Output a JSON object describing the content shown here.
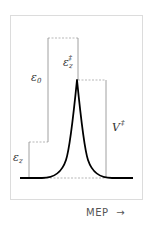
{
  "diagram": {
    "type": "energy-profile",
    "axis_label": "MEP",
    "axis_arrow": "→",
    "labels": {
      "epsilon_z": {
        "base": "ε",
        "sub": "z"
      },
      "epsilon_0": {
        "base": "ε",
        "sub": "0"
      },
      "epsilon_z_dagger": {
        "base": "ε",
        "sub": "z",
        "sup": "‡"
      },
      "V_dagger": {
        "base": "V",
        "sup": "‡"
      }
    },
    "colors": {
      "curve": "#000000",
      "guide_lines": "#888888",
      "frame": "#dcdcdc",
      "text": "#333333"
    }
  }
}
